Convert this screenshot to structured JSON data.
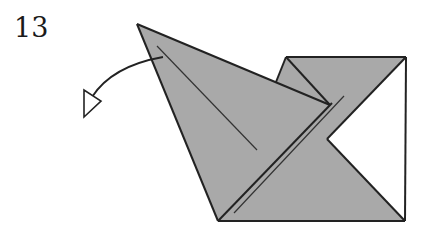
{
  "step": {
    "number": "13"
  },
  "diagram": {
    "fill_color": "#a9a9a9",
    "line_color": "#222222",
    "background": "#ffffff",
    "arrow": {
      "type": "valley-fold-unfold",
      "head": "hollow-triangle",
      "direction": "left"
    }
  }
}
